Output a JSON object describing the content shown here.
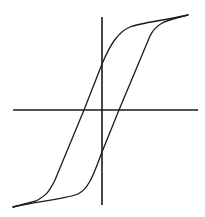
{
  "diagram": {
    "type": "hysteresis-loop",
    "labels": [],
    "colors": {
      "line": "#1a1a1a",
      "background": "#ffffff"
    },
    "axes": {
      "horizontal": {
        "x1": 13,
        "x2": 198,
        "y": 110
      },
      "vertical": {
        "x": 102,
        "y1": 17,
        "y2": 205
      }
    },
    "curves": {
      "ascending_branch": "M13,207 C40,201 70,198 78,194 C90,188 95,170 102,152 L119,110 L150,36 C156,24 163,21 188,15",
      "descending_branch": "M188,15 C160,21 140,23 130,27 C118,32 110,45 102,64 L84,110 L55,180 C48,194 45,196 36,201 L13,207"
    }
  }
}
